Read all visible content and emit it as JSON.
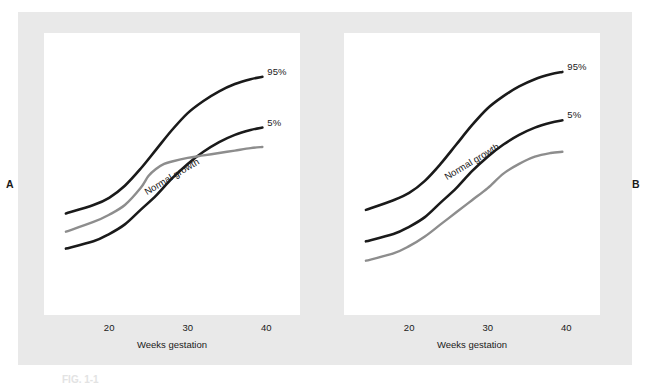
{
  "figure": {
    "background_color": "#ffffff",
    "band_color": "#e9e9e9",
    "plot_background": "#ffffff",
    "panel_letters": {
      "left": "A",
      "right": "B"
    },
    "caption_fragment": "FIG. 1-1"
  },
  "chart_data": [
    {
      "id": "panel-a",
      "type": "line",
      "title": "",
      "xlabel": "Weeks gestation",
      "ylabel": "",
      "xlim": [
        14,
        42
      ],
      "ylim": [
        0,
        100
      ],
      "xticks": [
        20,
        30,
        40
      ],
      "xticklabels": [
        "20",
        "30",
        "40"
      ],
      "grid": false,
      "legend": "none",
      "annotations": [
        {
          "text": "Normal growth",
          "rotation": -31,
          "x": 25,
          "y": 46
        }
      ],
      "series": [
        {
          "name": "95%",
          "label": "95%",
          "color": "#1a1a1a",
          "role": "normal-growth-upper-limit",
          "x": [
            14.5,
            18,
            20,
            22,
            24,
            26,
            28,
            30,
            32,
            34,
            36,
            38,
            39.5
          ],
          "values": [
            34.5,
            38,
            41,
            46,
            53,
            61,
            69,
            76,
            81,
            85,
            88,
            90,
            91
          ]
        },
        {
          "name": "5%",
          "label": "5%",
          "color": "#1a1a1a",
          "role": "normal-growth-lower-limit",
          "x": [
            14.5,
            18,
            20,
            22,
            24,
            26,
            28,
            30,
            32,
            34,
            36,
            38,
            39.5
          ],
          "values": [
            20,
            23,
            26,
            30,
            36,
            42,
            49,
            55,
            60,
            64,
            67,
            69,
            70
          ]
        },
        {
          "name": "Asymmetric growth restriction",
          "label": "",
          "color": "#8d8d8d",
          "role": "patient-curve",
          "x": [
            14.5,
            18,
            20,
            22,
            24,
            25,
            26,
            27,
            28,
            30,
            32,
            34,
            36,
            38,
            39.5
          ],
          "values": [
            27,
            31,
            34,
            38,
            45,
            50,
            53,
            55,
            56,
            57.5,
            58.5,
            59.5,
            60.5,
            61.5,
            62
          ]
        }
      ]
    },
    {
      "id": "panel-b",
      "type": "line",
      "title": "",
      "xlabel": "Weeks gestation",
      "ylabel": "",
      "xlim": [
        14,
        42
      ],
      "ylim": [
        0,
        100
      ],
      "xticks": [
        20,
        30,
        40
      ],
      "xticklabels": [
        "20",
        "30",
        "40"
      ],
      "grid": false,
      "legend": "none",
      "annotations": [
        {
          "text": "Normal growth",
          "rotation": -31,
          "x": 25,
          "y": 52
        }
      ],
      "series": [
        {
          "name": "95%",
          "label": "95%",
          "color": "#1a1a1a",
          "role": "normal-growth-upper-limit",
          "x": [
            14.5,
            18,
            20,
            22,
            24,
            26,
            28,
            30,
            32,
            34,
            36,
            38,
            39.5
          ],
          "values": [
            36,
            40,
            43,
            48,
            55,
            63,
            71,
            78,
            83,
            87,
            90,
            92,
            93
          ]
        },
        {
          "name": "5%",
          "label": "5%",
          "color": "#1a1a1a",
          "role": "normal-growth-lower-limit",
          "x": [
            14.5,
            18,
            20,
            22,
            24,
            26,
            28,
            30,
            32,
            34,
            36,
            38,
            39.5
          ],
          "values": [
            23,
            26,
            29,
            33,
            39,
            45,
            52,
            58,
            63,
            67,
            70,
            72,
            73
          ]
        },
        {
          "name": "Symmetric growth restriction",
          "label": "",
          "color": "#8d8d8d",
          "role": "patient-curve",
          "x": [
            14.5,
            18,
            20,
            22,
            24,
            26,
            28,
            30,
            32,
            34,
            36,
            38,
            39.5
          ],
          "values": [
            15,
            18,
            21,
            25,
            30,
            35,
            40,
            45,
            51,
            55,
            58,
            59.5,
            60
          ]
        }
      ]
    }
  ]
}
